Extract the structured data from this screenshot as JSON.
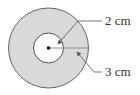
{
  "diagram": {
    "type": "concentric-circles",
    "outer_circle": {
      "cx": 48.5,
      "cy": 48,
      "r": 40,
      "fill": "#d9d9d9",
      "stroke": "#555555"
    },
    "inner_circle": {
      "cx": 48.5,
      "cy": 48,
      "r": 15,
      "fill": "#ffffff",
      "stroke": "#444444"
    },
    "center_point": {
      "cx": 48.5,
      "cy": 48,
      "r": 1.8,
      "fill": "#000000"
    },
    "labels": {
      "inner_radius": "2 cm",
      "outer_width": "3 cm"
    }
  }
}
